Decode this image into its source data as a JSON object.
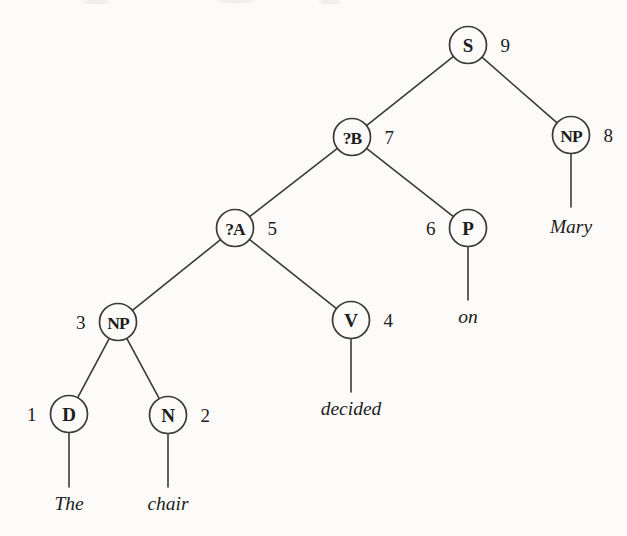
{
  "figure": {
    "kind": "syntax-parse-tree",
    "background_color": "#fcfbf9",
    "ink_color": "#3b3a38",
    "text_color": "#1d1c1b"
  },
  "nodes": [
    {
      "id": "n9",
      "label": "S",
      "index": "9",
      "index_side": "right",
      "cx": 468,
      "cy": 45,
      "r": 18.5
    },
    {
      "id": "n7",
      "label": "?B",
      "index": "7",
      "index_side": "right",
      "cx": 352,
      "cy": 137,
      "r": 18.5
    },
    {
      "id": "n8",
      "label": "NP",
      "index": "8",
      "index_side": "right",
      "cx": 571,
      "cy": 135,
      "r": 18.5
    },
    {
      "id": "n5",
      "label": "?A",
      "index": "5",
      "index_side": "right",
      "cx": 235,
      "cy": 228,
      "r": 18.5
    },
    {
      "id": "n6",
      "label": "P",
      "index": "6",
      "index_side": "left",
      "cx": 468,
      "cy": 228,
      "r": 18.5
    },
    {
      "id": "n3",
      "label": "NP",
      "index": "3",
      "index_side": "left",
      "cx": 118,
      "cy": 322,
      "r": 18.5
    },
    {
      "id": "n4",
      "label": "V",
      "index": "4",
      "index_side": "right",
      "cx": 351,
      "cy": 320,
      "r": 18.5
    },
    {
      "id": "n1",
      "label": "D",
      "index": "1",
      "index_side": "left",
      "cx": 69,
      "cy": 414,
      "r": 18.5
    },
    {
      "id": "n2",
      "label": "N",
      "index": "2",
      "index_side": "right",
      "cx": 168,
      "cy": 415,
      "r": 18.5
    }
  ],
  "edges": [
    {
      "from": "n9",
      "to": "n7"
    },
    {
      "from": "n9",
      "to": "n8"
    },
    {
      "from": "n7",
      "to": "n5"
    },
    {
      "from": "n7",
      "to": "n6"
    },
    {
      "from": "n5",
      "to": "n3"
    },
    {
      "from": "n5",
      "to": "n4"
    },
    {
      "from": "n3",
      "to": "n1"
    },
    {
      "from": "n3",
      "to": "n2"
    }
  ],
  "terminals": [
    {
      "id": "t1",
      "word": "The",
      "parent": "n1",
      "x": 69,
      "stem_top": 433,
      "stem_bottom": 487,
      "text_y": 510
    },
    {
      "id": "t2",
      "word": "chair",
      "parent": "n2",
      "x": 168,
      "stem_top": 434,
      "stem_bottom": 487,
      "text_y": 510
    },
    {
      "id": "t3",
      "word": "decided",
      "parent": "n4",
      "x": 351,
      "stem_top": 339,
      "stem_bottom": 392,
      "text_y": 415
    },
    {
      "id": "t4",
      "word": "on",
      "parent": "n6",
      "x": 468,
      "stem_top": 247,
      "stem_bottom": 300,
      "text_y": 323
    },
    {
      "id": "t5",
      "word": "Mary",
      "parent": "n8",
      "x": 571,
      "stem_top": 154,
      "stem_bottom": 207,
      "text_y": 233
    }
  ],
  "sentence": "The chair decided on Mary",
  "index_offset": 14
}
